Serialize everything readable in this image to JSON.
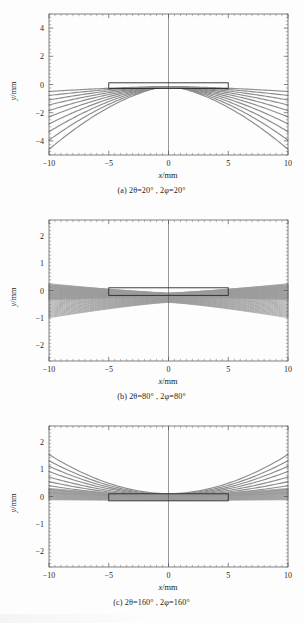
{
  "figure": {
    "panel_layout": "three stacked cartesian plots",
    "curve_color": "#8c8c8c",
    "frame_color": "#4a4a4a",
    "specimen_color": "#2b2b2b"
  },
  "panels": [
    {
      "id": "a",
      "caption": "(a) 2θ=20° , 2φ=20°",
      "top": 6,
      "plot_top": 14,
      "plot_height": 141,
      "caption_top": 186,
      "chart_data": {
        "type": "line",
        "title": "(a) 2θ=20° , 2φ=20°",
        "xlabel": "x/mm",
        "ylabel": "y/mm",
        "xlim": [
          -10,
          10
        ],
        "ylim": [
          -5,
          5
        ],
        "xticks": [
          -10,
          -5,
          0,
          5,
          10
        ],
        "yticks": [
          4,
          2,
          0,
          -2,
          -4
        ],
        "xticklabels": [
          "−10",
          "−5",
          "0",
          "5",
          "10"
        ],
        "yticklabels": [
          "4",
          "2",
          "0",
          "−2",
          "−4"
        ],
        "grid": false,
        "legend": "none",
        "annotations": [
          {
            "name": "specimen-box",
            "x0": -5,
            "x1": 5,
            "y0": -0.28,
            "y1": 0.12
          }
        ],
        "series_description": "two mirrored fans of 10 hyperbolic rays converging near y=0 and diverging downward to y=-4.6 at x=±10",
        "series": [
          {
            "name": "fan-right-to-left",
            "count": 10,
            "direction": "left",
            "y_at_far_edge": [
              -4.6,
              -3.95,
              -3.35,
              -2.8,
              -2.3,
              -1.85,
              -1.45,
              -1.1,
              -0.78,
              -0.5
            ],
            "y_at_near_edge": [
              -0.15,
              -0.15,
              -0.15,
              -0.15,
              -0.15,
              -0.15,
              -0.15,
              -0.15,
              -0.15,
              -0.15
            ]
          },
          {
            "name": "fan-left-to-right",
            "count": 10,
            "direction": "right",
            "y_at_far_edge": [
              -4.6,
              -3.95,
              -3.35,
              -2.8,
              -2.3,
              -1.85,
              -1.45,
              -1.1,
              -0.78,
              -0.5
            ],
            "y_at_near_edge": [
              -0.15,
              -0.15,
              -0.15,
              -0.15,
              -0.15,
              -0.15,
              -0.15,
              -0.15,
              -0.15,
              -0.15
            ]
          }
        ]
      }
    },
    {
      "id": "b",
      "caption": "(b) 2θ=80° , 2φ=80°",
      "top": 212,
      "plot_top": 220,
      "plot_height": 141,
      "caption_top": 392,
      "chart_data": {
        "type": "line",
        "title": "(b) 2θ=80° , 2φ=80°",
        "xlabel": "x/mm",
        "ylabel": "y/mm",
        "xlim": [
          -10,
          10
        ],
        "ylim": [
          -2.6,
          2.6
        ],
        "xticks": [
          -10,
          -5,
          0,
          5,
          10
        ],
        "yticks": [
          2,
          1,
          0,
          -1,
          -2
        ],
        "xticklabels": [
          "−10",
          "−5",
          "0",
          "5",
          "10"
        ],
        "yticklabels": [
          "2",
          "1",
          "0",
          "−1",
          "−2"
        ],
        "grid": false,
        "legend": "none",
        "annotations": [
          {
            "name": "specimen-box",
            "x0": -5,
            "x1": 5,
            "y0": -0.18,
            "y1": 0.1
          }
        ],
        "series_description": "dense bundle of ~60 near-horizontal rays forming a solid band from y=+0.25 to y=-1.0 at the edges, pinching to a waist at x=0",
        "series": [
          {
            "name": "dense-band-upper",
            "count": 30,
            "y_at_far_edge_top": 0.25,
            "y_at_far_edge_bottom": -0.45,
            "y_at_center": -0.12
          },
          {
            "name": "dense-band-lower",
            "count": 30,
            "y_at_far_edge_top": -0.55,
            "y_at_far_edge_bottom": -1.0,
            "y_at_center": -0.45
          }
        ]
      }
    },
    {
      "id": "c",
      "caption": "(c) 2θ=160° , 2φ=160°",
      "top": 418,
      "plot_top": 426,
      "plot_height": 141,
      "caption_top": 598,
      "chart_data": {
        "type": "line",
        "title": "(c) 2θ=160° , 2φ=160°",
        "xlabel": "x/mm",
        "ylabel": "y/mm",
        "xlim": [
          -10,
          10
        ],
        "ylim": [
          -2.6,
          2.6
        ],
        "xticks": [
          -10,
          -5,
          0,
          5,
          10
        ],
        "yticks": [
          2,
          1,
          0,
          -1,
          -2
        ],
        "xticklabels": [
          "−10",
          "−5",
          "0",
          "5",
          "10"
        ],
        "yticklabels": [
          "2",
          "1",
          "0",
          "−1",
          "−2"
        ],
        "grid": false,
        "legend": "none",
        "annotations": [
          {
            "name": "specimen-box",
            "x0": -5,
            "x1": 5,
            "y0": -0.16,
            "y1": 0.1
          }
        ],
        "series_description": "family of upward-opening parabolic arcs, symmetric about x=0, rising from a dense band near y=0 to y=1.55 at x=±10",
        "series": [
          {
            "name": "arc-family",
            "count": 9,
            "y_at_edge": [
              1.55,
              1.32,
              1.12,
              0.92,
              0.72,
              0.55,
              0.4,
              0.26,
              0.14
            ],
            "y_at_center": [
              0.1,
              0.08,
              0.06,
              0.05,
              0.04,
              0.03,
              0.02,
              0.01,
              0.0
            ]
          }
        ]
      }
    }
  ],
  "axis_labels": {
    "x": "x/mm",
    "y": "y/mm"
  }
}
